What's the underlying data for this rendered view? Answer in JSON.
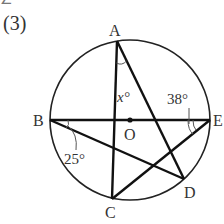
{
  "header": {
    "cut_off_text": "∠ ° ° ° °",
    "problem_number": "(3)"
  },
  "diagram": {
    "circle": {
      "center_label": "O",
      "cx": 130,
      "cy": 120,
      "r": 80
    },
    "points": {
      "A": {
        "label": "A",
        "x": 117,
        "y": 41
      },
      "B": {
        "label": "B",
        "x": 50,
        "y": 120
      },
      "C": {
        "label": "C",
        "x": 112,
        "y": 199
      },
      "D": {
        "label": "D",
        "x": 184,
        "y": 179
      },
      "E": {
        "label": "E",
        "x": 210,
        "y": 120
      }
    },
    "segments": [
      "AC",
      "AD",
      "BE",
      "BD",
      "CE"
    ],
    "angles": {
      "at_A": "x°",
      "at_E": "38°",
      "at_B": "25°"
    },
    "stroke_color": "#222222"
  }
}
